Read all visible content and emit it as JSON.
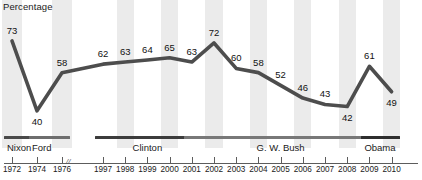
{
  "chart_data": {
    "type": "line",
    "title": "",
    "subtitle": "",
    "ylabel": "Percentage",
    "xlabel": "",
    "grid": false,
    "legend": "none",
    "ylim": [
      30,
      80
    ],
    "categories": [
      "1972",
      "1974",
      "1976",
      "1997",
      "1998",
      "1999",
      "2000",
      "2001",
      "2002",
      "2003",
      "2004",
      "2005",
      "2006",
      "2007",
      "2008",
      "2009",
      "2010"
    ],
    "values": [
      73,
      40,
      58,
      62,
      63,
      64,
      65,
      63,
      72,
      60,
      58,
      52,
      46,
      43,
      42,
      61,
      49
    ],
    "axis_break_after": "1976",
    "annotations": [
      {
        "x": "1972",
        "y": 73,
        "text": "73",
        "position": "above"
      },
      {
        "x": "1974",
        "y": 40,
        "text": "40",
        "position": "below"
      },
      {
        "x": "1976",
        "y": 58,
        "text": "58",
        "position": "above"
      },
      {
        "x": "1997",
        "y": 62,
        "text": "62",
        "position": "above"
      },
      {
        "x": "1998",
        "y": 63,
        "text": "63",
        "position": "above"
      },
      {
        "x": "1999",
        "y": 64,
        "text": "64",
        "position": "above"
      },
      {
        "x": "2000",
        "y": 65,
        "text": "65",
        "position": "above"
      },
      {
        "x": "2001",
        "y": 63,
        "text": "63",
        "position": "above"
      },
      {
        "x": "2002",
        "y": 72,
        "text": "72",
        "position": "above"
      },
      {
        "x": "2003",
        "y": 60,
        "text": "60",
        "position": "above"
      },
      {
        "x": "2004",
        "y": 58,
        "text": "58",
        "position": "above"
      },
      {
        "x": "2005",
        "y": 52,
        "text": "52",
        "position": "above"
      },
      {
        "x": "2006",
        "y": 46,
        "text": "46",
        "position": "above"
      },
      {
        "x": "2007",
        "y": 43,
        "text": "43",
        "position": "above"
      },
      {
        "x": "2008",
        "y": 42,
        "text": "42",
        "position": "below"
      },
      {
        "x": "2009",
        "y": 61,
        "text": "61",
        "position": "above"
      },
      {
        "x": "2010",
        "y": 49,
        "text": "49",
        "position": "below"
      }
    ],
    "eras": [
      {
        "label": "Nixon",
        "start": "1972",
        "end": "1974",
        "color": "#4a4a4a"
      },
      {
        "label": "Ford",
        "start": "1974",
        "end": "1976",
        "color": "#6e6e6e"
      },
      {
        "label": "Clinton",
        "start": "1997",
        "end": "2001",
        "color": "#3c3c3c"
      },
      {
        "label": "G. W. Bush",
        "start": "2001",
        "end": "2009",
        "color": "#787878"
      },
      {
        "label": "Obama",
        "start": "2009",
        "end": "2010",
        "color": "#2e2e2e"
      }
    ],
    "series_color": "#4d4d4d",
    "band_color": "#ebebeb"
  },
  "axis": {
    "break_symbol": "//",
    "tick_years": [
      "1972",
      "1974",
      "1976",
      "1997",
      "1998",
      "1999",
      "2000",
      "2001",
      "2002",
      "2003",
      "2004",
      "2005",
      "2006",
      "2007",
      "2008",
      "2009",
      "2010"
    ]
  }
}
